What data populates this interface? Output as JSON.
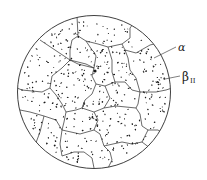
{
  "figure": {
    "labels": [
      {
        "id": "alpha",
        "text": "α",
        "target": "grain boundary / alpha matrix"
      },
      {
        "id": "beta",
        "text": "β",
        "subscript": "II",
        "target": "dispersed secondary beta particle"
      }
    ],
    "colors": {
      "line": "#2a2a2a",
      "particles": "#1a1a1a",
      "background": "#ffffff"
    }
  }
}
